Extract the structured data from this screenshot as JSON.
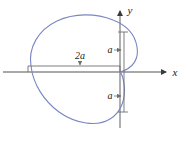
{
  "figure": {
    "kind": "cardioid-polar-curve",
    "background_color": "#ffffff"
  },
  "colors": {
    "curve": "#7a86c2",
    "axis": "#8d8d8d",
    "dimension_line": "#6f6f6f",
    "text": "#1a1a1a"
  },
  "axes": {
    "x_axis": {
      "label": "x",
      "name": "x-axis",
      "y_position": 72,
      "x_start": 3,
      "x_end": 168,
      "arrow": "right"
    },
    "y_axis": {
      "label": "y",
      "name": "y-axis",
      "x_position": 120,
      "y_start": 128,
      "y_end": 9,
      "arrow": "up"
    },
    "origin": {
      "x": 120,
      "y": 72
    }
  },
  "dimensions": [
    {
      "id": "width-2a",
      "label": "2a",
      "orientation": "horizontal",
      "from": {
        "x": 28,
        "y": 66
      },
      "to": {
        "x": 120,
        "y": 66
      },
      "label_position": {
        "x": 80,
        "y": 60
      },
      "meaning": "overall width of the cardioid along the x-axis"
    },
    {
      "id": "upper-a",
      "label": "a",
      "orientation": "vertical",
      "from": {
        "x": 124,
        "y": 32
      },
      "to": {
        "x": 124,
        "y": 72
      },
      "label_position": {
        "x": 110,
        "y": 50
      },
      "meaning": "height of the upper lobe above the x-axis"
    },
    {
      "id": "lower-a",
      "label": "a",
      "orientation": "vertical",
      "from": {
        "x": 124,
        "y": 72
      },
      "to": {
        "x": 124,
        "y": 112
      },
      "label_position": {
        "x": 110,
        "y": 96
      },
      "meaning": "depth of the lower lobe below the x-axis"
    }
  ],
  "curve": {
    "name": "cardioid-curve",
    "path": "M 120 72 C 134 68 139 58 137 47 C 135 34 126 25 113 20 C 96 13 74 13 57 21 C 38 30 28 48 31 66 C 33 84 44 101 59 112 C 76 124 97 127 110 119 C 122 112 126 97 124 84 C 123 77 122 74 120 72 Z",
    "stroke_width": 1.1,
    "extents": {
      "leftmost_x": 28,
      "rightmost_x": 139,
      "topmost_y": 13,
      "bottommost_y": 127,
      "cusp": {
        "x": 120,
        "y": 72
      }
    }
  }
}
